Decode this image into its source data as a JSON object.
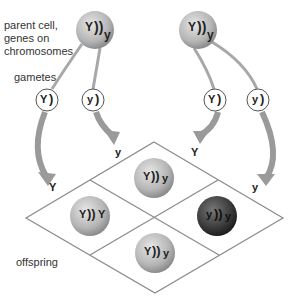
{
  "labels": {
    "parent_line1": "parent cell,",
    "parent_line2": "genes on",
    "parent_line3": "chromosomes",
    "gametes": "gametes",
    "offspring": "offspring"
  },
  "parents": [
    {
      "genotype_left": "Y",
      "genotype_right": "y",
      "label": "Yy"
    },
    {
      "genotype_left": "Y",
      "genotype_right": "y",
      "label": "Yy"
    }
  ],
  "gametes": [
    {
      "allele": "Y"
    },
    {
      "allele": "y"
    },
    {
      "allele": "Y"
    },
    {
      "allele": "y"
    }
  ],
  "grid_headers": {
    "left_top": "Y",
    "left_bottom": "y",
    "right_top": "Y",
    "right_bottom": "y"
  },
  "offspring": [
    {
      "position": "top",
      "left": "Y",
      "right": "y",
      "shade": "light"
    },
    {
      "position": "left",
      "left": "Y",
      "right": "Y",
      "shade": "light"
    },
    {
      "position": "right",
      "left": "y",
      "right": "y",
      "shade": "dark"
    },
    {
      "position": "bottom",
      "left": "Y",
      "right": "y",
      "shade": "light"
    }
  ],
  "colors": {
    "cell_light": "#b8b8b8",
    "cell_dark": "#3a3a3a",
    "arrow": "#9a9a9a",
    "grid_line": "#8a8a8a"
  }
}
